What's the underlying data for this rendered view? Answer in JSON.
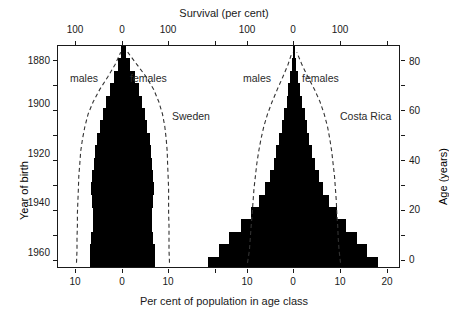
{
  "chart_data": {
    "type": "bar",
    "title": "Survival (per cent)",
    "xlabel": "Per cent of population in age class",
    "ylabel_left": "Year of birth",
    "ylabel_right": "Age (years)",
    "grid": false,
    "legend_position": "inline-annotations",
    "top_axis": {
      "label": "Survival (per cent)",
      "ticks_sweden": [
        {
          "value": 100,
          "text": "100",
          "side": "males"
        },
        {
          "value": 0,
          "text": "0",
          "side": "center"
        },
        {
          "value": 100,
          "text": "100",
          "side": "females"
        }
      ],
      "ticks_costa_rica": [
        {
          "value": 100,
          "text": "100",
          "side": "males"
        },
        {
          "value": 0,
          "text": "0",
          "side": "center"
        },
        {
          "value": 100,
          "text": "100",
          "side": "females"
        }
      ]
    },
    "bottom_axis": {
      "label": "Per cent of population in age class",
      "ticks_sweden": [
        "10",
        "0",
        "10"
      ],
      "ticks_costa_rica": [
        "10",
        "0",
        "10",
        "20"
      ],
      "unit": "per cent"
    },
    "left_axis": {
      "label": "Year of birth",
      "ticks": [
        "1880",
        "1900",
        "1920",
        "1940",
        "1960"
      ],
      "range": [
        1970,
        1872
      ]
    },
    "right_axis": {
      "label": "Age (years)",
      "ticks": [
        "0",
        "20",
        "40",
        "60",
        "80"
      ],
      "range": [
        0,
        90
      ]
    },
    "age_classes": [
      "0-4",
      "5-9",
      "10-14",
      "15-19",
      "20-24",
      "25-29",
      "30-34",
      "35-39",
      "40-44",
      "45-49",
      "50-54",
      "55-59",
      "60-64",
      "65-69",
      "70-74",
      "75-79",
      "80-84",
      "85-89"
    ],
    "panels": [
      {
        "name": "Sweden",
        "annotation": "Sweden",
        "males_label": "males",
        "females_label": "females",
        "males_pct": [
          7.1,
          7.2,
          6.8,
          6.5,
          6.4,
          6.6,
          6.8,
          6.6,
          6.2,
          6.0,
          5.6,
          4.9,
          4.3,
          3.6,
          2.8,
          1.9,
          1.0,
          0.4
        ],
        "females_pct": [
          6.8,
          6.9,
          6.5,
          6.2,
          6.2,
          6.4,
          6.6,
          6.5,
          6.2,
          6.1,
          5.8,
          5.2,
          4.7,
          4.1,
          3.4,
          2.5,
          1.5,
          0.7
        ],
        "survival_males_pct": [
          100,
          99,
          99,
          98,
          98,
          97,
          96,
          95,
          93,
          91,
          87,
          82,
          75,
          64,
          50,
          33,
          17,
          5
        ],
        "survival_females_pct": [
          100,
          99,
          99,
          99,
          98,
          98,
          98,
          97,
          96,
          95,
          93,
          90,
          85,
          77,
          66,
          50,
          30,
          10
        ]
      },
      {
        "name": "Costa Rica",
        "annotation": "Costa Rica",
        "males_label": "males",
        "females_label": "females",
        "males_pct": [
          18.6,
          16.2,
          14.0,
          11.4,
          9.3,
          7.6,
          6.2,
          5.2,
          4.4,
          3.8,
          3.2,
          2.6,
          2.1,
          1.6,
          1.2,
          0.8,
          0.5,
          0.2
        ],
        "females_pct": [
          18.1,
          15.8,
          13.6,
          11.2,
          9.2,
          7.6,
          6.3,
          5.3,
          4.5,
          3.9,
          3.3,
          2.8,
          2.3,
          1.8,
          1.3,
          0.9,
          0.5,
          0.2
        ],
        "survival_males_pct": [
          100,
          96,
          94,
          92,
          90,
          88,
          86,
          83,
          80,
          76,
          71,
          65,
          57,
          47,
          36,
          24,
          13,
          4
        ],
        "survival_females_pct": [
          100,
          97,
          95,
          94,
          92,
          91,
          89,
          87,
          84,
          81,
          77,
          72,
          65,
          56,
          44,
          30,
          17,
          6
        ]
      }
    ],
    "colors": {
      "bar": "#000000",
      "axis": "#1a1a1a",
      "center_line": "#b4b4b4",
      "survival_curve": "#333333",
      "background": "#ffffff"
    }
  }
}
